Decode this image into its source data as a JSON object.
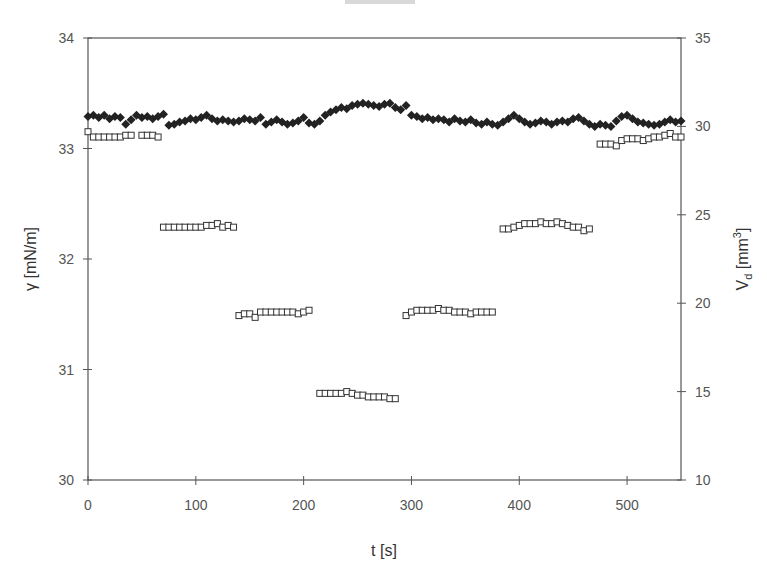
{
  "chart_data": {
    "type": "scatter",
    "title": "",
    "xlabel": "t [s]",
    "ylabel_left": "γ [mN/m]",
    "ylabel_right": "V_d [mm³]",
    "xlim": [
      0,
      550
    ],
    "ylim_left": [
      30,
      34
    ],
    "ylim_right": [
      10,
      35
    ],
    "x_ticks": [
      0,
      100,
      200,
      300,
      400,
      500
    ],
    "y_ticks_left": [
      30,
      31,
      32,
      33,
      34
    ],
    "y_ticks_right": [
      10,
      15,
      20,
      25,
      30,
      35
    ],
    "grid": false,
    "legend": null,
    "series": [
      {
        "name": "surface tension γ",
        "axis": "left",
        "marker": "filled-diamond",
        "color": "#222222",
        "points": [
          [
            0,
            33.29
          ],
          [
            5,
            33.3
          ],
          [
            10,
            33.28
          ],
          [
            15,
            33.3
          ],
          [
            20,
            33.27
          ],
          [
            25,
            33.29
          ],
          [
            30,
            33.28
          ],
          [
            35,
            33.22
          ],
          [
            40,
            33.26
          ],
          [
            45,
            33.3
          ],
          [
            50,
            33.28
          ],
          [
            55,
            33.29
          ],
          [
            60,
            33.27
          ],
          [
            65,
            33.29
          ],
          [
            70,
            33.31
          ],
          [
            75,
            33.21
          ],
          [
            80,
            33.22
          ],
          [
            85,
            33.24
          ],
          [
            90,
            33.25
          ],
          [
            95,
            33.27
          ],
          [
            100,
            33.26
          ],
          [
            105,
            33.28
          ],
          [
            110,
            33.3
          ],
          [
            115,
            33.27
          ],
          [
            120,
            33.25
          ],
          [
            125,
            33.26
          ],
          [
            130,
            33.25
          ],
          [
            135,
            33.24
          ],
          [
            140,
            33.25
          ],
          [
            145,
            33.27
          ],
          [
            150,
            33.26
          ],
          [
            155,
            33.25
          ],
          [
            160,
            33.28
          ],
          [
            165,
            33.22
          ],
          [
            170,
            33.24
          ],
          [
            175,
            33.26
          ],
          [
            180,
            33.24
          ],
          [
            185,
            33.22
          ],
          [
            190,
            33.23
          ],
          [
            195,
            33.25
          ],
          [
            200,
            33.28
          ],
          [
            205,
            33.23
          ],
          [
            210,
            33.22
          ],
          [
            215,
            33.25
          ],
          [
            220,
            33.3
          ],
          [
            225,
            33.33
          ],
          [
            230,
            33.35
          ],
          [
            235,
            33.37
          ],
          [
            240,
            33.36
          ],
          [
            245,
            33.39
          ],
          [
            250,
            33.4
          ],
          [
            255,
            33.41
          ],
          [
            260,
            33.4
          ],
          [
            265,
            33.39
          ],
          [
            270,
            33.38
          ],
          [
            275,
            33.4
          ],
          [
            280,
            33.41
          ],
          [
            285,
            33.37
          ],
          [
            290,
            33.35
          ],
          [
            295,
            33.39
          ],
          [
            300,
            33.3
          ],
          [
            305,
            33.29
          ],
          [
            310,
            33.27
          ],
          [
            315,
            33.28
          ],
          [
            320,
            33.26
          ],
          [
            325,
            33.27
          ],
          [
            330,
            33.26
          ],
          [
            335,
            33.24
          ],
          [
            340,
            33.27
          ],
          [
            345,
            33.25
          ],
          [
            350,
            33.24
          ],
          [
            355,
            33.26
          ],
          [
            360,
            33.23
          ],
          [
            365,
            33.22
          ],
          [
            370,
            33.24
          ],
          [
            375,
            33.22
          ],
          [
            380,
            33.21
          ],
          [
            385,
            33.24
          ],
          [
            390,
            33.27
          ],
          [
            395,
            33.3
          ],
          [
            400,
            33.27
          ],
          [
            405,
            33.24
          ],
          [
            410,
            33.22
          ],
          [
            415,
            33.23
          ],
          [
            420,
            33.25
          ],
          [
            425,
            33.24
          ],
          [
            430,
            33.22
          ],
          [
            435,
            33.24
          ],
          [
            440,
            33.25
          ],
          [
            445,
            33.24
          ],
          [
            450,
            33.27
          ],
          [
            455,
            33.28
          ],
          [
            460,
            33.25
          ],
          [
            465,
            33.22
          ],
          [
            470,
            33.2
          ],
          [
            475,
            33.22
          ],
          [
            480,
            33.21
          ],
          [
            485,
            33.2
          ],
          [
            490,
            33.25
          ],
          [
            495,
            33.29
          ],
          [
            500,
            33.3
          ],
          [
            505,
            33.27
          ],
          [
            510,
            33.24
          ],
          [
            515,
            33.23
          ],
          [
            520,
            33.22
          ],
          [
            525,
            33.21
          ],
          [
            530,
            33.22
          ],
          [
            535,
            33.24
          ],
          [
            540,
            33.26
          ],
          [
            545,
            33.24
          ],
          [
            550,
            33.25
          ]
        ]
      },
      {
        "name": "drop volume V_d",
        "axis": "right",
        "marker": "open-square",
        "color": "#333333",
        "points": [
          [
            0,
            29.7
          ],
          [
            5,
            29.4
          ],
          [
            10,
            29.4
          ],
          [
            15,
            29.4
          ],
          [
            20,
            29.4
          ],
          [
            25,
            29.4
          ],
          [
            30,
            29.4
          ],
          [
            35,
            29.5
          ],
          [
            40,
            29.5
          ],
          [
            50,
            29.5
          ],
          [
            55,
            29.5
          ],
          [
            60,
            29.5
          ],
          [
            65,
            29.4
          ],
          [
            70,
            24.3
          ],
          [
            75,
            24.3
          ],
          [
            80,
            24.3
          ],
          [
            85,
            24.3
          ],
          [
            90,
            24.3
          ],
          [
            95,
            24.3
          ],
          [
            100,
            24.3
          ],
          [
            105,
            24.3
          ],
          [
            110,
            24.4
          ],
          [
            115,
            24.4
          ],
          [
            120,
            24.5
          ],
          [
            125,
            24.3
          ],
          [
            130,
            24.4
          ],
          [
            135,
            24.3
          ],
          [
            140,
            19.3
          ],
          [
            145,
            19.4
          ],
          [
            150,
            19.4
          ],
          [
            155,
            19.2
          ],
          [
            160,
            19.5
          ],
          [
            165,
            19.5
          ],
          [
            170,
            19.5
          ],
          [
            175,
            19.5
          ],
          [
            180,
            19.5
          ],
          [
            185,
            19.5
          ],
          [
            190,
            19.5
          ],
          [
            195,
            19.4
          ],
          [
            200,
            19.5
          ],
          [
            205,
            19.6
          ],
          [
            215,
            14.9
          ],
          [
            220,
            14.9
          ],
          [
            225,
            14.9
          ],
          [
            230,
            14.9
          ],
          [
            235,
            14.9
          ],
          [
            240,
            15.0
          ],
          [
            245,
            14.9
          ],
          [
            250,
            14.8
          ],
          [
            255,
            14.8
          ],
          [
            260,
            14.7
          ],
          [
            265,
            14.7
          ],
          [
            270,
            14.7
          ],
          [
            275,
            14.7
          ],
          [
            280,
            14.6
          ],
          [
            285,
            14.6
          ],
          [
            295,
            19.3
          ],
          [
            300,
            19.5
          ],
          [
            305,
            19.6
          ],
          [
            310,
            19.6
          ],
          [
            315,
            19.6
          ],
          [
            320,
            19.6
          ],
          [
            325,
            19.7
          ],
          [
            330,
            19.6
          ],
          [
            335,
            19.6
          ],
          [
            340,
            19.5
          ],
          [
            345,
            19.5
          ],
          [
            350,
            19.5
          ],
          [
            355,
            19.4
          ],
          [
            360,
            19.5
          ],
          [
            365,
            19.5
          ],
          [
            370,
            19.5
          ],
          [
            375,
            19.5
          ],
          [
            385,
            24.2
          ],
          [
            390,
            24.2
          ],
          [
            395,
            24.3
          ],
          [
            400,
            24.4
          ],
          [
            405,
            24.5
          ],
          [
            410,
            24.5
          ],
          [
            415,
            24.5
          ],
          [
            420,
            24.6
          ],
          [
            425,
            24.5
          ],
          [
            430,
            24.5
          ],
          [
            435,
            24.6
          ],
          [
            440,
            24.5
          ],
          [
            445,
            24.4
          ],
          [
            450,
            24.3
          ],
          [
            455,
            24.3
          ],
          [
            460,
            24.1
          ],
          [
            465,
            24.2
          ],
          [
            475,
            29.0
          ],
          [
            480,
            29.0
          ],
          [
            485,
            29.0
          ],
          [
            490,
            28.9
          ],
          [
            495,
            29.2
          ],
          [
            500,
            29.3
          ],
          [
            505,
            29.3
          ],
          [
            510,
            29.3
          ],
          [
            515,
            29.2
          ],
          [
            520,
            29.3
          ],
          [
            525,
            29.4
          ],
          [
            530,
            29.4
          ],
          [
            535,
            29.5
          ],
          [
            540,
            29.6
          ],
          [
            545,
            29.4
          ],
          [
            550,
            29.4
          ]
        ]
      }
    ]
  },
  "labels": {
    "xlabel": "t [s]",
    "ylabel_left": "γ [mN/m]",
    "ylabel_right_main": "V",
    "ylabel_right_sub": "d",
    "ylabel_right_unit_pre": " [mm",
    "ylabel_right_unit_sup": "3",
    "ylabel_right_unit_post": "]"
  }
}
